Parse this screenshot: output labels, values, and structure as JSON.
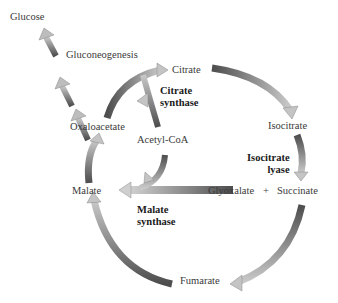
{
  "metabolites": {
    "glucose": "Glucose",
    "gluconeogenesis": "Gluconeogenesis",
    "citrate": "Citrate",
    "isocitrate": "Isocitrate",
    "oxaloacetate": "Oxaloacetate",
    "acetyl_coa": "Acetyl-CoA",
    "malate": "Malate",
    "glyoxalate": "Glyoxalate",
    "plus": "+",
    "succinate": "Succinate",
    "fumarate": "Fumarate"
  },
  "enzymes": {
    "citrate_synthase_line1": "Citrate",
    "citrate_synthase_line2": "synthase",
    "isocitrate_lyase_line1": "Isocitrate",
    "isocitrate_lyase_line2": "lyase",
    "malate_synthase_line1": "Malate",
    "malate_synthase_line2": "synthase"
  },
  "colors": {
    "arrow_dark": "#555555",
    "arrow_light": "#c8c8c8",
    "text": "#3a3a3a",
    "enzyme_text": "#1a1a1a",
    "background": "#ffffff"
  }
}
